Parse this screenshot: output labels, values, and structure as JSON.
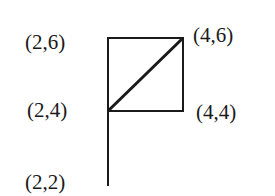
{
  "diagram": {
    "points": [
      {
        "label": "(2,6)",
        "x": 2,
        "y": 6
      },
      {
        "label": "(4,6)",
        "x": 4,
        "y": 6
      },
      {
        "label": "(2,4)",
        "x": 2,
        "y": 4
      },
      {
        "label": "(4,4)",
        "x": 4,
        "y": 4
      },
      {
        "label": "(2,2)",
        "x": 2,
        "y": 2
      }
    ],
    "segments": [
      {
        "from": "(2,6)",
        "to": "(4,6)"
      },
      {
        "from": "(4,6)",
        "to": "(4,4)"
      },
      {
        "from": "(4,4)",
        "to": "(2,4)"
      },
      {
        "from": "(2,4)",
        "to": "(2,6)"
      },
      {
        "from": "(2,4)",
        "to": "(4,6)"
      },
      {
        "from": "(2,4)",
        "to": "(2,2)"
      }
    ],
    "line_color": "#1a1a1a"
  }
}
